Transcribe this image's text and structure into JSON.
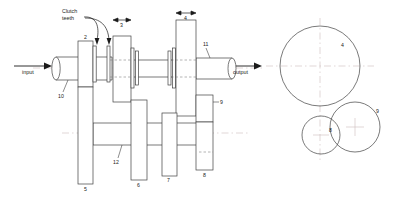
{
  "figure": {
    "background_color": "#ffffff",
    "line_color": "#404040",
    "centerline_color": "#c9b9b9",
    "text_color": "#1a1a1a"
  },
  "annotations": {
    "clutch_teeth": "Clutch\nteeth",
    "clutch_teeth_line1": "Clutch",
    "clutch_teeth_line2": "teeth",
    "input": "input",
    "output": "output"
  },
  "part_numbers": {
    "p2": "2",
    "p3": "3",
    "p4": "4",
    "p5": "5",
    "p6": "6",
    "p7": "7",
    "p8": "8",
    "p9": "9",
    "p10": "10",
    "p11": "11",
    "p12": "12"
  },
  "circle_diagram": {
    "circles": [
      {
        "id": "4",
        "label": "4",
        "cx": 320,
        "cy": 66,
        "r": 40
      },
      {
        "id": "9",
        "label": "9",
        "cx": 355,
        "cy": 127,
        "r": 25
      },
      {
        "id": "8",
        "label": "8",
        "cx": 321,
        "cy": 135,
        "r": 19
      }
    ],
    "label_positions": [
      {
        "id": "4",
        "x": 342,
        "y": 45
      },
      {
        "id": "9",
        "x": 377,
        "y": 111
      },
      {
        "id": "8",
        "x": 330,
        "y": 130
      }
    ]
  },
  "dimension_arrows": [
    {
      "id": "3",
      "label": "3",
      "x1": 113,
      "x2": 131,
      "y": 22
    },
    {
      "id": "4",
      "label": "4",
      "x1": 176,
      "x2": 196,
      "y": 15
    }
  ]
}
